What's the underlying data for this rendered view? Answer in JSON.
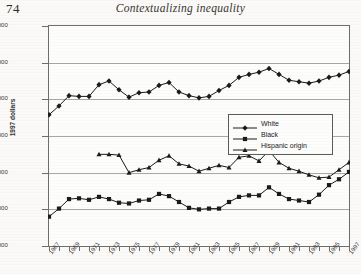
{
  "page": {
    "folio": "74",
    "running_head": "Contextualizing inequality"
  },
  "chart_data": {
    "type": "line",
    "title": "",
    "xlabel": "",
    "ylabel": "1997 dollars",
    "ylim": [
      15000,
      45000
    ],
    "ytick_values": [
      45000,
      40000,
      35000,
      30000,
      25000,
      20000,
      15000
    ],
    "ytick_labels": [
      "45,000",
      "40,000",
      "35,000",
      "30,000",
      "25,000",
      "20,000",
      "15,000"
    ],
    "xlim": [
      1967,
      1997
    ],
    "xtick_labels": [
      "1967",
      "1969",
      "1971",
      "1973",
      "1975",
      "1977",
      "1979",
      "1981",
      "1983",
      "1985",
      "1987",
      "1989",
      "1991",
      "1993",
      "1995",
      "1997"
    ],
    "grid": "horizontal",
    "legend_position": "center-right",
    "x": [
      1967,
      1968,
      1969,
      1970,
      1971,
      1972,
      1973,
      1974,
      1975,
      1976,
      1977,
      1978,
      1979,
      1980,
      1981,
      1982,
      1983,
      1984,
      1985,
      1986,
      1987,
      1988,
      1989,
      1990,
      1991,
      1992,
      1993,
      1994,
      1995,
      1996,
      1997
    ],
    "series": [
      {
        "name": "White",
        "marker": "diamond",
        "color": "#1a1a1a",
        "values": [
          32900,
          34100,
          35500,
          35400,
          35400,
          37000,
          37500,
          36300,
          35300,
          35900,
          36000,
          36900,
          37300,
          36000,
          35500,
          35200,
          35400,
          36200,
          36900,
          38000,
          38400,
          38700,
          39200,
          38400,
          37600,
          37400,
          37200,
          37500,
          38000,
          38300,
          38800
        ]
      },
      {
        "name": "Black",
        "marker": "square",
        "color": "#1a1a1a",
        "values": [
          19000,
          20100,
          21400,
          21500,
          21300,
          21700,
          21400,
          20900,
          20800,
          21200,
          21300,
          22100,
          21800,
          21000,
          20200,
          20000,
          20100,
          20100,
          21000,
          21700,
          21900,
          21900,
          23000,
          22100,
          21400,
          21200,
          21000,
          22000,
          23300,
          24100,
          25100
        ]
      },
      {
        "name": "Hispanic origin",
        "marker": "triangle",
        "color": "#1a1a1a",
        "values": [
          null,
          null,
          null,
          null,
          null,
          27500,
          27500,
          27400,
          25000,
          25400,
          25700,
          26700,
          27300,
          26200,
          25900,
          25200,
          25600,
          26000,
          25700,
          27100,
          27300,
          26600,
          28000,
          26400,
          25600,
          25200,
          24700,
          24300,
          24400,
          25400,
          26400
        ]
      }
    ]
  },
  "legend": {
    "items": [
      {
        "label": "White",
        "marker": "diamond"
      },
      {
        "label": "Black",
        "marker": "square"
      },
      {
        "label": "Hispanic origin",
        "marker": "triangle"
      }
    ]
  }
}
